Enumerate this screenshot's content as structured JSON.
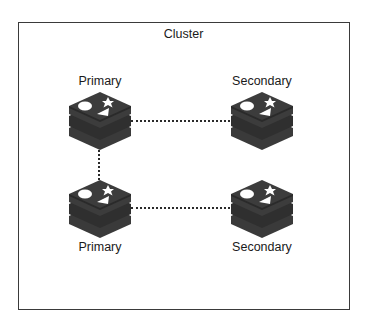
{
  "diagram": {
    "title": "Cluster",
    "colors": {
      "border": "#3a3a3a",
      "icon_dark": "#3c3c3c",
      "icon_mid": "#2e2e2e",
      "icon_shapes": "#ffffff",
      "link": "#2a2a2a"
    },
    "nodes": [
      {
        "id": "primary-1",
        "label": "Primary",
        "role": "primary",
        "icon": "database-stack-icon"
      },
      {
        "id": "secondary-1",
        "label": "Secondary",
        "role": "secondary",
        "icon": "database-stack-icon"
      },
      {
        "id": "primary-2",
        "label": "Primary",
        "role": "primary",
        "icon": "database-stack-icon"
      },
      {
        "id": "secondary-2",
        "label": "Secondary",
        "role": "secondary",
        "icon": "database-stack-icon"
      }
    ],
    "links": [
      {
        "from": "primary-1",
        "to": "secondary-1",
        "style": "dotted"
      },
      {
        "from": "primary-1",
        "to": "primary-2",
        "style": "dotted"
      },
      {
        "from": "primary-2",
        "to": "secondary-2",
        "style": "dotted"
      }
    ]
  }
}
